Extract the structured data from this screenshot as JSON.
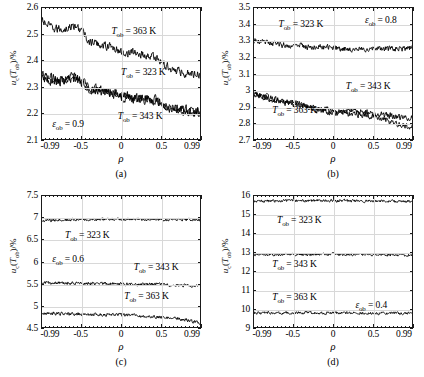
{
  "figure": {
    "x_axis_label": "ρ",
    "y_axis_label_prefix": "u",
    "y_axis_label_sub": "c",
    "y_axis_label_mid": "(T",
    "y_axis_label_sub2": "ob",
    "y_axis_label_suffix": ")/%"
  },
  "panels": [
    {
      "caption": "(a)",
      "epsilon_label": "ε",
      "epsilon_sub": "ob",
      "epsilon_value": "= 0.9",
      "yticks": [
        "2.1",
        "2.2",
        "2.3",
        "2.4",
        "2.5",
        "2.6"
      ],
      "xticks": [
        "-0.99",
        "-0.5",
        "0",
        "0.5",
        "0.99"
      ],
      "annotations": [
        {
          "name": "series-label-363k",
          "t": "T",
          "sub": "ob",
          "v": "= 363 K"
        },
        {
          "name": "series-label-323k",
          "t": "T",
          "sub": "ob",
          "v": "= 323 K"
        },
        {
          "name": "series-label-343k",
          "t": "T",
          "sub": "ob",
          "v": "= 343 K"
        }
      ]
    },
    {
      "caption": "(b)",
      "epsilon_label": "ε",
      "epsilon_sub": "ob",
      "epsilon_value": "= 0.8",
      "yticks": [
        "2.7",
        "2.8",
        "2.9",
        "3",
        "3.1",
        "3.2",
        "3.3",
        "3.4",
        "3.5"
      ],
      "xticks": [
        "-0.99",
        "-0.5",
        "0",
        "0.5",
        "0.99"
      ],
      "annotations": [
        {
          "name": "series-label-323k",
          "t": "T",
          "sub": "ob",
          "v": "= 323 K"
        },
        {
          "name": "series-label-343k",
          "t": "T",
          "sub": "ob",
          "v": "= 343 K"
        },
        {
          "name": "series-label-363k",
          "t": "T",
          "sub": "ob",
          "v": "= 363 K"
        }
      ]
    },
    {
      "caption": "(c)",
      "epsilon_label": "ε",
      "epsilon_sub": "ob",
      "epsilon_value": "= 0.6",
      "yticks": [
        "4.5",
        "5",
        "5.5",
        "6",
        "6.5",
        "7",
        "7.5"
      ],
      "xticks": [
        "-0.99",
        "-0.5",
        "0",
        "0.5",
        "0.99"
      ],
      "annotations": [
        {
          "name": "series-label-323k",
          "t": "T",
          "sub": "ob",
          "v": "= 323 K"
        },
        {
          "name": "series-label-343k",
          "t": "T",
          "sub": "ob",
          "v": "= 343 K"
        },
        {
          "name": "series-label-363k",
          "t": "T",
          "sub": "ob",
          "v": "= 363 K"
        }
      ]
    },
    {
      "caption": "(d)",
      "epsilon_label": "ε",
      "epsilon_sub": "ob",
      "epsilon_value": "= 0.4",
      "yticks": [
        "9",
        "10",
        "11",
        "12",
        "13",
        "14",
        "15",
        "16"
      ],
      "xticks": [
        "-0.99",
        "-0.5",
        "0",
        "0.5",
        "0.99"
      ],
      "annotations": [
        {
          "name": "series-label-323k",
          "t": "T",
          "sub": "ob",
          "v": "= 323 K"
        },
        {
          "name": "series-label-343k",
          "t": "T",
          "sub": "ob",
          "v": "= 343 K"
        },
        {
          "name": "series-label-363k",
          "t": "T",
          "sub": "ob",
          "v": "= 363 K"
        }
      ]
    }
  ],
  "chart_data": [
    {
      "type": "line",
      "panel": "(a)",
      "title": "",
      "xlabel": "ρ",
      "ylabel": "u_c(T_ob)/%",
      "xlim": [
        -0.99,
        0.99
      ],
      "ylim": [
        2.1,
        2.6
      ],
      "yticks": [
        2.1,
        2.2,
        2.3,
        2.4,
        2.5,
        2.6
      ],
      "xticks": [
        -0.99,
        -0.5,
        0,
        0.5,
        0.99
      ],
      "grid": true,
      "legend": "inline-annotations",
      "annotation": "ε_ob = 0.9",
      "noise_amplitude": 0.022,
      "series": [
        {
          "name": "T_ob = 363 K",
          "x": [
            -0.99,
            -0.85,
            -0.7,
            -0.6,
            -0.5,
            -0.4,
            -0.25,
            -0.1,
            0.0,
            0.15,
            0.3,
            0.45,
            0.55,
            0.7,
            0.85,
            0.99
          ],
          "values": [
            2.55,
            2.52,
            2.52,
            2.53,
            2.52,
            2.47,
            2.46,
            2.45,
            2.43,
            2.43,
            2.42,
            2.41,
            2.38,
            2.36,
            2.35,
            2.35
          ]
        },
        {
          "name": "T_ob = 323 K",
          "x": [
            -0.99,
            -0.85,
            -0.7,
            -0.6,
            -0.5,
            -0.4,
            -0.25,
            -0.1,
            0.0,
            0.15,
            0.3,
            0.45,
            0.55,
            0.7,
            0.85,
            0.99
          ],
          "values": [
            2.34,
            2.33,
            2.33,
            2.34,
            2.33,
            2.3,
            2.29,
            2.28,
            2.27,
            2.26,
            2.26,
            2.25,
            2.23,
            2.22,
            2.21,
            2.21
          ]
        },
        {
          "name": "T_ob = 343 K",
          "x": [
            -0.99,
            -0.85,
            -0.7,
            -0.6,
            -0.5,
            -0.4,
            -0.25,
            -0.1,
            0.0,
            0.15,
            0.3,
            0.45,
            0.55,
            0.7,
            0.85,
            0.99
          ],
          "values": [
            2.33,
            2.32,
            2.32,
            2.33,
            2.32,
            2.29,
            2.28,
            2.27,
            2.26,
            2.25,
            2.25,
            2.24,
            2.22,
            2.21,
            2.2,
            2.2
          ]
        }
      ]
    },
    {
      "type": "line",
      "panel": "(b)",
      "title": "",
      "xlabel": "ρ",
      "ylabel": "u_c(T_ob)/%",
      "xlim": [
        -0.99,
        0.99
      ],
      "ylim": [
        2.7,
        3.5
      ],
      "yticks": [
        2.7,
        2.8,
        2.9,
        3.0,
        3.1,
        3.2,
        3.3,
        3.4,
        3.5
      ],
      "xticks": [
        -0.99,
        -0.5,
        0,
        0.5,
        0.99
      ],
      "grid": true,
      "legend": "inline-annotations",
      "annotation": "ε_ob = 0.8",
      "noise_amplitude": 0.024,
      "series": [
        {
          "name": "T_ob = 323 K",
          "x": [
            -0.99,
            -0.85,
            -0.7,
            -0.55,
            -0.4,
            -0.25,
            -0.1,
            0.0,
            0.15,
            0.3,
            0.45,
            0.6,
            0.75,
            0.9,
            0.99
          ],
          "values": [
            3.3,
            3.29,
            3.28,
            3.27,
            3.27,
            3.26,
            3.26,
            3.26,
            3.25,
            3.25,
            3.25,
            3.25,
            3.25,
            3.25,
            3.26
          ]
        },
        {
          "name": "T_ob = 343 K",
          "x": [
            -0.99,
            -0.85,
            -0.7,
            -0.55,
            -0.4,
            -0.25,
            -0.1,
            0.0,
            0.15,
            0.3,
            0.45,
            0.6,
            0.75,
            0.9,
            0.99
          ],
          "values": [
            2.98,
            2.96,
            2.94,
            2.93,
            2.91,
            2.89,
            2.88,
            2.87,
            2.87,
            2.87,
            2.86,
            2.85,
            2.84,
            2.83,
            2.83
          ]
        },
        {
          "name": "T_ob = 363 K",
          "x": [
            -0.99,
            -0.85,
            -0.7,
            -0.55,
            -0.4,
            -0.25,
            -0.1,
            0.0,
            0.15,
            0.3,
            0.45,
            0.6,
            0.75,
            0.9,
            0.99
          ],
          "values": [
            2.97,
            2.95,
            2.93,
            2.92,
            2.9,
            2.88,
            2.87,
            2.86,
            2.86,
            2.85,
            2.84,
            2.82,
            2.8,
            2.78,
            2.77
          ]
        }
      ]
    },
    {
      "type": "line",
      "panel": "(c)",
      "title": "",
      "xlabel": "ρ",
      "ylabel": "u_c(T_ob)/%",
      "xlim": [
        -0.99,
        0.99
      ],
      "ylim": [
        4.5,
        7.5
      ],
      "yticks": [
        4.5,
        5,
        5.5,
        6,
        6.5,
        7,
        7.5
      ],
      "xticks": [
        -0.99,
        -0.5,
        0,
        0.5,
        0.99
      ],
      "grid": true,
      "legend": "inline-annotations",
      "annotation": "ε_ob = 0.6",
      "noise_amplitude": 0.05,
      "series": [
        {
          "name": "T_ob = 323 K",
          "x": [
            -0.99,
            -0.7,
            -0.4,
            -0.1,
            0.0,
            0.2,
            0.45,
            0.7,
            0.99
          ],
          "values": [
            6.93,
            6.95,
            6.96,
            6.97,
            6.97,
            6.97,
            6.96,
            6.96,
            6.95
          ]
        },
        {
          "name": "T_ob = 343 K",
          "x": [
            -0.99,
            -0.7,
            -0.4,
            -0.1,
            0.0,
            0.2,
            0.45,
            0.7,
            0.99
          ],
          "values": [
            5.51,
            5.5,
            5.5,
            5.49,
            5.49,
            5.48,
            5.47,
            5.46,
            5.44
          ]
        },
        {
          "name": "T_ob = 363 K",
          "x": [
            -0.99,
            -0.7,
            -0.4,
            -0.1,
            0.0,
            0.2,
            0.45,
            0.7,
            0.99
          ],
          "values": [
            4.82,
            4.8,
            4.79,
            4.78,
            4.78,
            4.76,
            4.73,
            4.7,
            4.6
          ]
        }
      ]
    },
    {
      "type": "line",
      "panel": "(d)",
      "title": "",
      "xlabel": "ρ",
      "ylabel": "u_c(T_ob)/%",
      "xlim": [
        -0.99,
        0.99
      ],
      "ylim": [
        9,
        16
      ],
      "yticks": [
        9,
        10,
        11,
        12,
        13,
        14,
        15,
        16
      ],
      "xticks": [
        -0.99,
        -0.5,
        0,
        0.5,
        0.99
      ],
      "grid": true,
      "legend": "inline-annotations",
      "annotation": "ε_ob = 0.4",
      "noise_amplitude": 0.1,
      "series": [
        {
          "name": "T_ob = 323 K",
          "x": [
            -0.99,
            -0.7,
            -0.4,
            -0.1,
            0.0,
            0.2,
            0.45,
            0.7,
            0.99
          ],
          "values": [
            15.72,
            15.74,
            15.75,
            15.75,
            15.75,
            15.74,
            15.73,
            15.72,
            15.7
          ]
        },
        {
          "name": "T_ob = 343 K",
          "x": [
            -0.99,
            -0.7,
            -0.4,
            -0.1,
            0.0,
            0.2,
            0.45,
            0.7,
            0.99
          ],
          "values": [
            12.86,
            12.87,
            12.88,
            12.88,
            12.88,
            12.87,
            12.86,
            12.85,
            12.84
          ]
        },
        {
          "name": "T_ob = 363 K",
          "x": [
            -0.99,
            -0.7,
            -0.4,
            -0.1,
            0.0,
            0.2,
            0.45,
            0.7,
            0.99
          ],
          "values": [
            9.76,
            9.76,
            9.76,
            9.75,
            9.75,
            9.75,
            9.74,
            9.73,
            9.72
          ]
        }
      ]
    }
  ]
}
